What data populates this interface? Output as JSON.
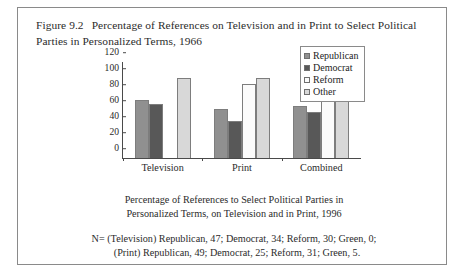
{
  "figure": {
    "number": "Figure 9.2",
    "title": "Percentage of References on Television and in Print to Select Political Parties in Personalized Terms, 1966"
  },
  "caption": {
    "line1": "Percentage of References to Select Political Parties in",
    "line2": "Personalized Terms, on Television and in Print, 1996"
  },
  "note": {
    "line1": "N= (Television) Republican, 47; Democrat, 34; Reform, 30; Green, 0;",
    "line2": "(Print)  Republican, 49; Democrat, 25; Reform, 31; Green, 5."
  },
  "colors": {
    "republican": "#909090",
    "democrat": "#585858",
    "reform": "#fbfbfb",
    "other": "#d8d8d8",
    "axis": "#4a4a4a",
    "frame": "#8a8a8a"
  },
  "chart_data": {
    "type": "bar",
    "title": "Percentage of References on Television and in Print to Select Political Parties in Personalized Terms, 1966",
    "xlabel": "",
    "ylabel": "",
    "ylim": [
      0,
      120
    ],
    "yticks": [
      0,
      20,
      40,
      60,
      80,
      100,
      120
    ],
    "grid": false,
    "legend_position": "right",
    "categories": [
      "Television",
      "Print",
      "Combined"
    ],
    "series": [
      {
        "name": "Republican",
        "values": [
          72,
          61,
          65
        ]
      },
      {
        "name": "Democrat",
        "values": [
          67,
          46,
          58
        ]
      },
      {
        "name": "Reform",
        "values": [
          0,
          93,
          94
        ]
      },
      {
        "name": "Other",
        "values": [
          100,
          100,
          99
        ]
      }
    ]
  }
}
